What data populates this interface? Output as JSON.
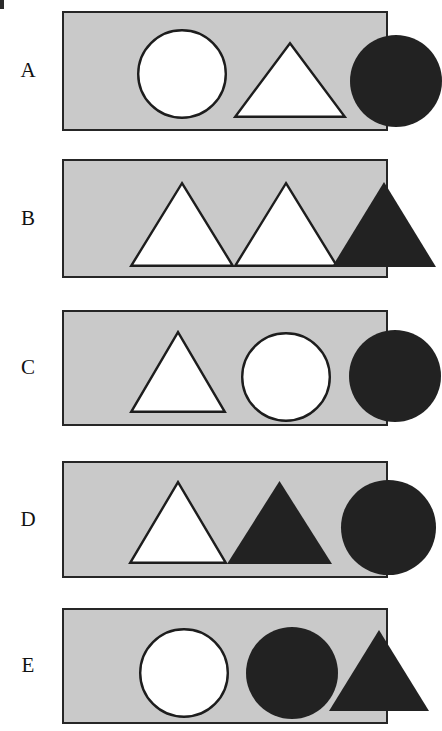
{
  "figure": {
    "background_color": "#ffffff",
    "panel_fill": "#c9c9c9",
    "panel_border_color": "#262626",
    "dark_shape_color": "#222222",
    "light_shape_color": "#ffffff",
    "shape_outline_color": "#1d1d1d",
    "corner_mark_color": "#2b2b2b"
  },
  "rows": [
    {
      "label": "A",
      "panel_top": 11,
      "panel_height": 120,
      "shapes": [
        {
          "name": "circle-outline-white",
          "type": "circle",
          "fill": "white",
          "x": 73,
          "y": 16,
          "size": 90
        },
        {
          "name": "triangle-outline-white",
          "type": "triangle",
          "fill": "white",
          "x": 170,
          "y": 29,
          "width": 112,
          "height": 76
        },
        {
          "name": "circle-solid-dark",
          "type": "circle",
          "fill": "dark",
          "x": 286,
          "y": 22,
          "size": 92
        }
      ]
    },
    {
      "label": "B",
      "panel_top": 159,
      "panel_height": 119,
      "shapes": [
        {
          "name": "triangle-outline-white",
          "type": "triangle",
          "fill": "white",
          "x": 66,
          "y": 21,
          "width": 104,
          "height": 85
        },
        {
          "name": "triangle-outline-white",
          "type": "triangle",
          "fill": "white",
          "x": 170,
          "y": 21,
          "width": 104,
          "height": 85
        },
        {
          "name": "triangle-solid-dark",
          "type": "triangle",
          "fill": "dark",
          "x": 268,
          "y": 21,
          "width": 104,
          "height": 85
        }
      ]
    },
    {
      "label": "C",
      "panel_top": 310,
      "panel_height": 116,
      "shapes": [
        {
          "name": "triangle-outline-white",
          "type": "triangle",
          "fill": "white",
          "x": 66,
          "y": 19,
          "width": 96,
          "height": 82
        },
        {
          "name": "circle-outline-white",
          "type": "circle",
          "fill": "white",
          "x": 177,
          "y": 20,
          "size": 90
        },
        {
          "name": "circle-solid-dark",
          "type": "circle",
          "fill": "dark",
          "x": 285,
          "y": 18,
          "size": 92
        }
      ]
    },
    {
      "label": "D",
      "panel_top": 461,
      "panel_height": 117,
      "shapes": [
        {
          "name": "triangle-outline-white",
          "type": "triangle",
          "fill": "white",
          "x": 65,
          "y": 18,
          "width": 98,
          "height": 83
        },
        {
          "name": "triangle-solid-dark",
          "type": "triangle",
          "fill": "dark",
          "x": 163,
          "y": 18,
          "width": 105,
          "height": 83
        },
        {
          "name": "circle-solid-dark",
          "type": "circle",
          "fill": "dark",
          "x": 277,
          "y": 17,
          "size": 95
        }
      ]
    },
    {
      "label": "E",
      "panel_top": 608,
      "panel_height": 116,
      "shapes": [
        {
          "name": "circle-outline-white",
          "type": "circle",
          "fill": "white",
          "x": 75,
          "y": 18,
          "size": 90
        },
        {
          "name": "circle-solid-dark",
          "type": "circle",
          "fill": "dark",
          "x": 182,
          "y": 17,
          "size": 92
        },
        {
          "name": "triangle-solid-dark",
          "type": "triangle",
          "fill": "dark",
          "x": 265,
          "y": 20,
          "width": 100,
          "height": 81
        }
      ]
    }
  ]
}
